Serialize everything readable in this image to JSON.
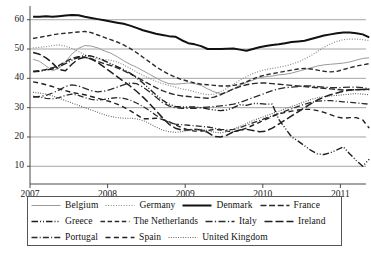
{
  "chart_data": {
    "type": "line",
    "title": "",
    "xlabel": "",
    "ylabel": "",
    "ylim": [
      6,
      64
    ],
    "yticks": [
      10,
      20,
      30,
      40,
      50,
      60
    ],
    "xlim": [
      2007.0,
      2011.33
    ],
    "xticks": [
      2007,
      2008,
      2009,
      2010,
      2011
    ],
    "xtick_labels": [
      "2007",
      "2008",
      "2009",
      "2010",
      "2011"
    ],
    "grid": "horizontal",
    "legend_position": "below",
    "x_start": 2007.04,
    "x_step": 0.0833,
    "series": [
      {
        "name": "Belgium",
        "style": "solid-light",
        "color": "#9a9a9a",
        "width": 1.0,
        "values": [
          46.5,
          45.8,
          44.2,
          42.6,
          43.4,
          45.6,
          48.3,
          50.2,
          51.2,
          51.0,
          50.4,
          49.4,
          48.6,
          47.4,
          46.0,
          44.8,
          43.8,
          42.6,
          41.4,
          40.2,
          39.0,
          38.2,
          38.0,
          38.2,
          38.4,
          38.2,
          37.6,
          36.4,
          35.4,
          34.8,
          35.2,
          36.4,
          37.6,
          38.6,
          39.4,
          40.2,
          40.6,
          40.8,
          41.2,
          41.4,
          41.8,
          42.4,
          43.0,
          43.6,
          44.2,
          44.6,
          44.8,
          45.0,
          45.2,
          45.6,
          46.2,
          46.8,
          47.0
        ]
      },
      {
        "name": "Germany",
        "style": "dotted",
        "color": "#8c8c8c",
        "width": 1.2,
        "values": [
          50.4,
          50.6,
          50.8,
          51.2,
          51.4,
          51.0,
          50.2,
          49.2,
          48.0,
          47.2,
          46.6,
          46.4,
          46.2,
          45.6,
          44.6,
          43.4,
          42.2,
          41.0,
          40.0,
          39.0,
          38.2,
          37.6,
          37.0,
          36.4,
          36.0,
          35.4,
          34.8,
          34.4,
          34.6,
          35.4,
          36.6,
          38.0,
          39.4,
          40.6,
          41.6,
          42.4,
          43.0,
          43.4,
          43.8,
          44.2,
          44.8,
          45.6,
          46.6,
          47.8,
          49.2,
          50.6,
          51.8,
          52.6,
          53.2,
          53.4,
          53.4,
          53.2,
          52.9
        ]
      },
      {
        "name": "Denmark",
        "style": "solid-thick",
        "color": "#111111",
        "width": 2.0,
        "values": [
          61.0,
          61.0,
          61.2,
          61.0,
          61.2,
          61.4,
          61.6,
          61.5,
          61.0,
          60.6,
          60.2,
          59.8,
          59.4,
          59.0,
          58.6,
          58.0,
          57.2,
          56.4,
          55.8,
          55.2,
          54.8,
          54.4,
          54.2,
          53.0,
          52.0,
          51.6,
          51.0,
          50.0,
          50.0,
          50.0,
          50.1,
          50.2,
          49.8,
          49.4,
          50.0,
          50.6,
          51.0,
          51.4,
          51.6,
          52.0,
          52.4,
          52.6,
          52.8,
          53.4,
          54.0,
          54.6,
          55.0,
          55.4,
          55.6,
          55.6,
          55.4,
          55.0,
          54.0
        ]
      },
      {
        "name": "France",
        "style": "dash-long",
        "color": "#2b2b2b",
        "width": 1.4,
        "values": [
          42.4,
          42.6,
          43.0,
          43.6,
          44.4,
          45.6,
          46.8,
          47.4,
          47.2,
          46.6,
          45.8,
          45.0,
          44.4,
          43.6,
          42.6,
          41.6,
          40.4,
          39.2,
          38.0,
          36.8,
          35.8,
          35.0,
          34.4,
          34.0,
          33.8,
          33.6,
          33.4,
          33.2,
          33.6,
          34.4,
          35.4,
          36.4,
          37.2,
          37.8,
          38.2,
          38.4,
          38.4,
          38.2,
          38.0,
          37.8,
          37.6,
          37.4,
          37.2,
          37.0,
          36.8,
          36.6,
          36.4,
          36.2,
          36.0,
          36.0,
          36.1,
          36.2,
          36.3
        ]
      },
      {
        "name": "Greece",
        "style": "dash-dot-dot",
        "color": "#1f1f1f",
        "width": 1.4,
        "values": [
          42.2,
          42.4,
          42.8,
          43.2,
          44.0,
          45.0,
          46.2,
          47.2,
          47.8,
          47.6,
          47.0,
          46.0,
          45.0,
          44.0,
          43.0,
          41.8,
          40.2,
          38.4,
          36.4,
          34.4,
          32.6,
          31.2,
          30.4,
          30.2,
          30.2,
          30.2,
          30.0,
          29.6,
          29.2,
          29.0,
          29.2,
          30.0,
          31.0,
          30.8,
          31.4,
          31.4,
          31.2,
          31.2,
          26.0,
          23.0,
          20.0,
          18.6,
          17.0,
          15.4,
          14.2,
          14.0,
          14.6,
          15.6,
          16.6,
          14.2,
          12.0,
          10.0,
          12.4
        ]
      },
      {
        "name": "The Netherlands",
        "style": "dash-medium",
        "color": "#2b2b2b",
        "width": 1.4,
        "values": [
          53.6,
          54.0,
          54.4,
          54.8,
          55.2,
          55.4,
          55.6,
          55.8,
          56.0,
          55.6,
          54.8,
          54.0,
          53.2,
          52.4,
          51.4,
          50.2,
          48.8,
          47.2,
          45.6,
          44.0,
          42.6,
          41.4,
          40.4,
          39.6,
          39.0,
          38.4,
          38.0,
          37.8,
          37.6,
          37.4,
          37.4,
          37.6,
          38.0,
          38.8,
          39.8,
          40.6,
          41.2,
          41.6,
          42.0,
          42.4,
          42.8,
          43.2,
          43.4,
          43.2,
          42.8,
          42.4,
          42.2,
          42.4,
          43.0,
          43.6,
          44.2,
          44.6,
          45.0
        ]
      },
      {
        "name": "Italy",
        "style": "dash-dot",
        "color": "#2b2b2b",
        "width": 1.3,
        "values": [
          33.6,
          33.8,
          34.2,
          35.0,
          36.0,
          37.2,
          37.8,
          37.4,
          36.6,
          35.8,
          35.4,
          35.6,
          36.2,
          37.0,
          37.8,
          38.4,
          38.2,
          37.0,
          35.4,
          33.6,
          31.8,
          30.6,
          30.0,
          29.8,
          29.8,
          29.8,
          30.0,
          30.2,
          30.4,
          30.6,
          30.8,
          31.2,
          31.8,
          32.6,
          33.4,
          34.2,
          35.0,
          35.8,
          36.4,
          36.8,
          37.0,
          37.2,
          37.4,
          37.4,
          37.2,
          37.0,
          36.8,
          36.8,
          36.9,
          37.0,
          37.0,
          36.8,
          36.4
        ]
      },
      {
        "name": "Ireland",
        "style": "dash-xlong",
        "color": "#1f1f1f",
        "width": 1.5,
        "values": [
          48.8,
          48.2,
          47.0,
          45.2,
          43.0,
          42.6,
          44.8,
          46.6,
          47.2,
          46.6,
          45.4,
          43.8,
          42.2,
          40.6,
          39.0,
          37.4,
          35.6,
          33.6,
          31.4,
          29.0,
          26.6,
          24.4,
          23.0,
          22.4,
          22.4,
          22.6,
          22.4,
          21.6,
          20.2,
          20.0,
          20.6,
          21.8,
          22.4,
          22.6,
          22.2,
          21.8,
          22.0,
          23.0,
          24.4,
          25.8,
          27.2,
          28.6,
          30.0,
          31.4,
          32.6,
          33.6,
          34.4,
          35.0,
          35.6,
          36.0,
          36.2,
          36.2,
          36.2
        ]
      },
      {
        "name": "Portugal",
        "style": "dash-dot-short",
        "color": "#2b2b2b",
        "width": 1.3,
        "values": [
          33.8,
          33.6,
          33.2,
          33.0,
          33.4,
          34.2,
          34.6,
          34.2,
          33.4,
          32.8,
          32.6,
          32.8,
          33.2,
          33.4,
          33.2,
          32.6,
          31.6,
          30.4,
          29.0,
          27.4,
          26.0,
          25.0,
          24.4,
          24.2,
          24.0,
          23.8,
          23.6,
          23.4,
          23.0,
          22.6,
          22.4,
          22.6,
          23.2,
          24.0,
          24.8,
          25.6,
          26.4,
          27.2,
          28.0,
          28.8,
          29.6,
          30.4,
          31.2,
          31.8,
          32.2,
          32.4,
          32.4,
          32.2,
          32.0,
          31.8,
          31.6,
          31.4,
          31.2
        ]
      },
      {
        "name": "Spain",
        "style": "dash-even",
        "color": "#222222",
        "width": 1.4,
        "values": [
          38.8,
          38.4,
          37.8,
          37.2,
          36.4,
          35.8,
          35.2,
          34.8,
          34.4,
          33.8,
          33.2,
          32.6,
          32.0,
          31.2,
          30.2,
          29.0,
          27.6,
          26.2,
          26.2,
          26.4,
          26.0,
          25.2,
          24.2,
          23.2,
          22.4,
          22.0,
          22.0,
          22.2,
          22.6,
          22.4,
          22.0,
          21.8,
          22.2,
          23.0,
          24.0,
          25.0,
          26.0,
          27.0,
          27.8,
          28.4,
          28.8,
          29.2,
          29.4,
          29.4,
          29.0,
          28.4,
          27.6,
          26.8,
          26.4,
          26.6,
          26.6,
          25.8,
          23.0
        ]
      },
      {
        "name": "United Kingdom",
        "style": "dotted-fine",
        "color": "#555555",
        "width": 1.1,
        "values": [
          35.2,
          35.0,
          34.6,
          34.0,
          33.2,
          32.4,
          31.6,
          30.8,
          30.0,
          29.2,
          28.4,
          27.6,
          27.0,
          26.6,
          26.4,
          26.4,
          26.2,
          25.6,
          24.6,
          23.4,
          22.4,
          21.8,
          21.6,
          21.8,
          22.2,
          22.6,
          22.6,
          22.2,
          21.6,
          21.4,
          21.8,
          22.6,
          23.6,
          24.6,
          25.6,
          26.4,
          27.2,
          28.0,
          28.8,
          29.6,
          30.4,
          31.2,
          32.0,
          32.8,
          33.4,
          33.8,
          34.0,
          34.2,
          34.4,
          34.6,
          34.8,
          34.6,
          34.4
        ]
      }
    ]
  },
  "legend": {
    "rows": [
      [
        {
          "label": "Belgium",
          "series": 0
        },
        {
          "label": "Germany",
          "series": 1
        },
        {
          "label": "Denmark",
          "series": 2
        },
        {
          "label": "France",
          "series": 3
        }
      ],
      [
        {
          "label": "Greece",
          "series": 4
        },
        {
          "label": "The Netherlands",
          "series": 5
        },
        {
          "label": "Italy",
          "series": 6
        },
        {
          "label": "Ireland",
          "series": 7
        }
      ],
      [
        {
          "label": "Portugal",
          "series": 8
        },
        {
          "label": "Spain",
          "series": 9
        },
        {
          "label": "United Kingdom",
          "series": 10
        }
      ]
    ]
  },
  "axes": {
    "y_tick_labels": [
      "60",
      "50",
      "40",
      "30",
      "20",
      "10"
    ],
    "x_tick_labels": [
      "2007",
      "2008",
      "2009",
      "2010",
      "2011"
    ]
  },
  "colors": {
    "grid": "#9b9b9b",
    "axis": "#4a4a4a",
    "text": "#1a1a1a",
    "legend_border": "#555555"
  }
}
